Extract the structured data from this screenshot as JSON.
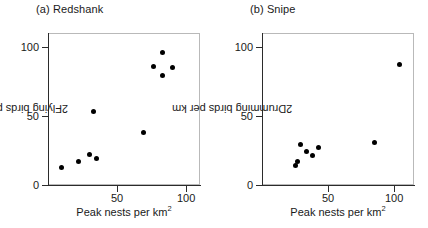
{
  "figure": {
    "width": 428,
    "height": 228,
    "background": "#ffffff",
    "marker_color": "#000000",
    "axis_color": "#2b2b2b",
    "frame_color": "#b9b9b9"
  },
  "chart_data": [
    {
      "type": "scatter",
      "title": "(a) Redshank",
      "xlabel": "Peak nests per km",
      "xlabel_superscript": "2",
      "ylabel": "Flying birds per km",
      "ylabel_superscript": "2",
      "xlim": [
        0,
        110
      ],
      "ylim": [
        0,
        110
      ],
      "xticks": [
        50,
        100
      ],
      "xticklabels": [
        "50",
        "100"
      ],
      "yticks": [
        0,
        50,
        100
      ],
      "yticklabels": [
        "0",
        "50",
        "100"
      ],
      "grid": false,
      "legend": null,
      "points": [
        {
          "x": 10,
          "y": 13
        },
        {
          "x": 22,
          "y": 17
        },
        {
          "x": 30,
          "y": 22
        },
        {
          "x": 35,
          "y": 19
        },
        {
          "x": 33,
          "y": 53
        },
        {
          "x": 69,
          "y": 38
        },
        {
          "x": 76,
          "y": 86
        },
        {
          "x": 83,
          "y": 96
        },
        {
          "x": 83,
          "y": 79
        },
        {
          "x": 90,
          "y": 85
        }
      ]
    },
    {
      "type": "scatter",
      "title": "(b) Snipe",
      "xlabel": "Peak nests per km",
      "xlabel_superscript": "2",
      "ylabel": "Drumming birds per km",
      "ylabel_superscript": "2",
      "xlim": [
        0,
        115
      ],
      "ylim": [
        0,
        110
      ],
      "xticks": [
        50,
        100
      ],
      "xticklabels": [
        "50",
        "100"
      ],
      "yticks": [
        0,
        50,
        100
      ],
      "yticklabels": [
        "0",
        "50",
        "100"
      ],
      "grid": false,
      "legend": null,
      "points": [
        {
          "x": 25,
          "y": 14
        },
        {
          "x": 27,
          "y": 17
        },
        {
          "x": 29,
          "y": 29
        },
        {
          "x": 34,
          "y": 24
        },
        {
          "x": 38,
          "y": 21
        },
        {
          "x": 43,
          "y": 27
        },
        {
          "x": 85,
          "y": 31
        },
        {
          "x": 104,
          "y": 87
        }
      ]
    }
  ]
}
